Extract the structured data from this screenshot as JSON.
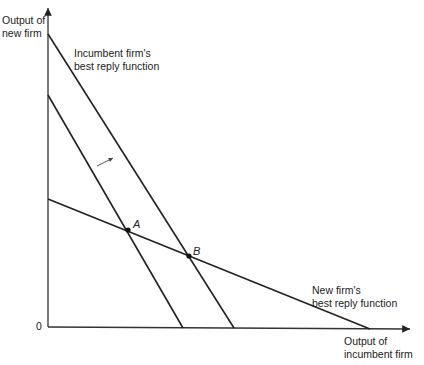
{
  "diagram": {
    "y_axis_label": [
      "Output of",
      "new firm"
    ],
    "x_axis_label": [
      "Output of",
      "incumbent firm"
    ],
    "origin_label": "0",
    "incumbent_label": [
      "Incumbent firm's",
      "best reply function"
    ],
    "new_firm_label": [
      "New firm's",
      "best reply function"
    ],
    "points": [
      {
        "name": "A",
        "x": 128,
        "y": 230
      },
      {
        "name": "B",
        "x": 189,
        "y": 256
      }
    ],
    "lines": {
      "incumbent_original": {
        "x1": 48,
        "y1": 95,
        "x2": 183,
        "y2": 328
      },
      "incumbent_shifted": {
        "x1": 48,
        "y1": 34,
        "x2": 234,
        "y2": 328
      },
      "new_firm": {
        "x1": 48,
        "y1": 199,
        "x2": 370,
        "y2": 329
      }
    },
    "shift_arrow": {
      "x1": 97,
      "y1": 166,
      "x2": 114,
      "y2": 157
    }
  }
}
